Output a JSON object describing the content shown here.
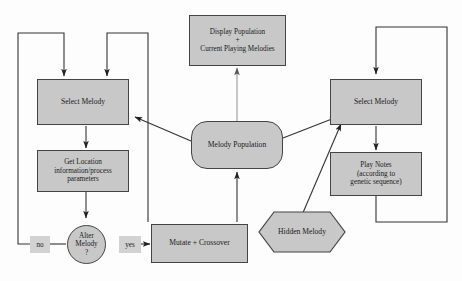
{
  "diagram": {
    "type": "flowchart",
    "colors": {
      "node_fill": "#c8c8c8",
      "node_stroke": "#444444",
      "edge_stroke": "#333333",
      "label_fill": "#d2d2d2",
      "dashed_edge_stroke": "#9a9a9a",
      "background": "#fdfdfd"
    },
    "nodes": [
      {
        "id": "display-population",
        "shape": "rect",
        "lines": [
          "Display Population",
          "+",
          "Current Playing Melodies"
        ]
      },
      {
        "id": "select-melody-left",
        "shape": "rect",
        "lines": [
          "Select Melody"
        ]
      },
      {
        "id": "get-location",
        "shape": "rect",
        "lines": [
          "Get Location",
          "information/process",
          "parameters"
        ]
      },
      {
        "id": "alter-melody",
        "shape": "circle",
        "lines": [
          "Alter",
          "Melody",
          "?"
        ]
      },
      {
        "id": "mutate-crossover",
        "shape": "rect",
        "lines": [
          "Mutate + Crossover"
        ]
      },
      {
        "id": "melody-population",
        "shape": "rounded",
        "lines": [
          "Melody Population"
        ]
      },
      {
        "id": "hidden-melody",
        "shape": "hexagon",
        "lines": [
          "Hidden Melody"
        ]
      },
      {
        "id": "select-melody-right",
        "shape": "rect",
        "lines": [
          "Select Melody"
        ]
      },
      {
        "id": "play-notes",
        "shape": "rect",
        "lines": [
          "Play Notes",
          "(according to",
          "genetic sequence)"
        ]
      }
    ],
    "edge_labels": [
      {
        "id": "no-label",
        "text": "no"
      },
      {
        "id": "yes-label",
        "text": "yes"
      }
    ]
  }
}
